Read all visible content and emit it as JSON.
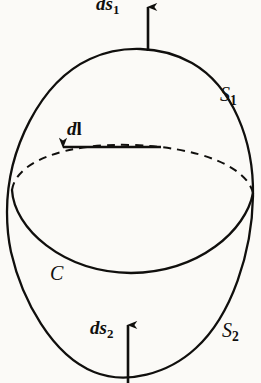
{
  "figure": {
    "kind": "physics-diagram",
    "background_color": "#fbfaf7",
    "ink_color": "#100f0d",
    "labels": {
      "ds1": {
        "base": "d",
        "symbol": "s",
        "subscript": "1"
      },
      "s1": {
        "symbol": "S",
        "subscript": "1"
      },
      "dl": {
        "base": "d",
        "symbol": "l"
      },
      "c": {
        "symbol": "C"
      },
      "ds2": {
        "base": "d",
        "symbol": "s",
        "subscript": "2"
      },
      "s2": {
        "symbol": "S",
        "subscript": "2"
      }
    },
    "arrows": [
      {
        "name": "ds1-arrow",
        "direction": "up",
        "from": [
          148,
          51
        ],
        "to": [
          148,
          3
        ]
      },
      {
        "name": "dl-arrow",
        "direction": "left",
        "from": [
          161,
          147
        ],
        "to": [
          58,
          147
        ]
      },
      {
        "name": "ds2-arrow",
        "direction": "up",
        "from": [
          128,
          383
        ],
        "to": [
          128,
          321
        ]
      }
    ]
  }
}
